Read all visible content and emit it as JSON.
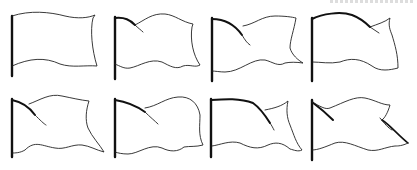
{
  "caption": "Eight hand-drawn waving flag outlines on poles",
  "colors": {
    "stroke": "#222222",
    "pole": "#111111",
    "background": "#ffffff"
  },
  "flags": [
    {
      "id": 1,
      "row": 1,
      "label": "flag-1",
      "variant": "gentle wave"
    },
    {
      "id": 2,
      "row": 1,
      "label": "flag-2",
      "variant": "fold near pole"
    },
    {
      "id": 3,
      "row": 1,
      "label": "flag-3",
      "variant": "deep fold"
    },
    {
      "id": 4,
      "row": 1,
      "label": "flag-4",
      "variant": "curled tip"
    },
    {
      "id": 5,
      "row": 2,
      "label": "flag-5",
      "variant": "diagonal fold"
    },
    {
      "id": 6,
      "row": 2,
      "label": "flag-6",
      "variant": "rounded wave"
    },
    {
      "id": 7,
      "row": 2,
      "label": "flag-7",
      "variant": "arched top"
    },
    {
      "id": 8,
      "row": 2,
      "label": "flag-8",
      "variant": "twisted tail"
    }
  ]
}
